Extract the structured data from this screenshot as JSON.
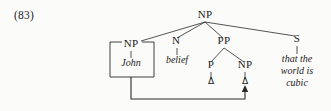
{
  "example": {
    "number_label": "(83)"
  },
  "tree": {
    "root": {
      "label": "NP",
      "x": 205,
      "y": 18
    },
    "nodes": [
      {
        "id": "np-subject",
        "label": "NP",
        "x": 131,
        "y": 47,
        "boxed": true
      },
      {
        "id": "n-head",
        "label": "N",
        "x": 176,
        "y": 44
      },
      {
        "id": "pp",
        "label": "PP",
        "x": 224,
        "y": 44
      },
      {
        "id": "s-clause",
        "label": "S",
        "x": 297,
        "y": 42
      },
      {
        "id": "p-prep",
        "label": "P",
        "x": 211,
        "y": 68
      },
      {
        "id": "np-object",
        "label": "NP",
        "x": 245,
        "y": 68
      }
    ],
    "terminals": [
      {
        "id": "john",
        "text": "John",
        "x": 131,
        "y": 66,
        "parent": "np-subject",
        "italic": true
      },
      {
        "id": "belief",
        "text": "belief",
        "x": 177,
        "y": 63,
        "parent": "n-head",
        "italic": true
      },
      {
        "id": "trace-p",
        "text": "Δ",
        "x": 211,
        "y": 84,
        "parent": "p-prep",
        "italic": false
      },
      {
        "id": "trace-np",
        "text": "Δ",
        "x": 245,
        "y": 84,
        "parent": "np-object",
        "italic": false
      },
      {
        "id": "s-line-1",
        "text": "that the",
        "x": 297,
        "y": 62,
        "parent": "s-clause",
        "italic": true
      },
      {
        "id": "s-line-2",
        "text": "world is",
        "x": 297,
        "y": 74,
        "parent": "s-clause",
        "italic": true
      },
      {
        "id": "s-line-3",
        "text": "cubic",
        "x": 297,
        "y": 86,
        "parent": "s-clause",
        "italic": true
      }
    ],
    "box": {
      "label": "NP",
      "x": 110,
      "y": 42,
      "width": 44,
      "height": 35
    },
    "movement": {
      "from_x": 131,
      "from_y": 77,
      "corner_y": 99,
      "to_x": 245,
      "arrow_tip_y": 86,
      "description": "coindexing-movement-arrow"
    }
  }
}
